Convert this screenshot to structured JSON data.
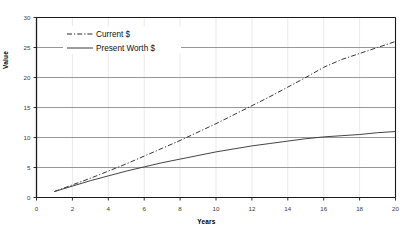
{
  "chart_data": {
    "type": "line",
    "title": "",
    "xlabel": "Years",
    "ylabel": "Value",
    "xlim": [
      0,
      20
    ],
    "ylim": [
      0,
      30
    ],
    "xticks": [
      0,
      2,
      4,
      6,
      8,
      10,
      12,
      14,
      16,
      18,
      20
    ],
    "yticks": [
      0,
      5,
      10,
      15,
      20,
      25,
      30
    ],
    "grid": "horizontal-major-and-vertical-minor",
    "legend_position": "upper-left-inside",
    "x": [
      1,
      2,
      3,
      4,
      5,
      6,
      7,
      8,
      9,
      10,
      11,
      12,
      13,
      14,
      15,
      16,
      17,
      18,
      19,
      20
    ],
    "series": [
      {
        "name": "Current $",
        "style": "dash-dot",
        "color": "#2b2b2b",
        "values": [
          1.0,
          2.1,
          3.2,
          4.4,
          5.6,
          6.9,
          8.2,
          9.5,
          10.9,
          12.3,
          13.8,
          15.3,
          16.8,
          18.4,
          20.0,
          21.7,
          23.0,
          24.0,
          25.0,
          26.0
        ]
      },
      {
        "name": "Present Worth $",
        "style": "solid",
        "color": "#3a3a3a",
        "values": [
          1.0,
          1.9,
          2.8,
          3.6,
          4.4,
          5.1,
          5.8,
          6.4,
          7.0,
          7.6,
          8.1,
          8.6,
          9.0,
          9.4,
          9.8,
          10.1,
          10.3,
          10.5,
          10.8,
          11.0
        ]
      }
    ]
  },
  "axis": {
    "y_tick_labels": [
      "0",
      "5",
      "10",
      "15",
      "20",
      "25",
      "30"
    ],
    "x_tick_labels": [
      "0",
      "2",
      "4",
      "6",
      "8",
      "10",
      "12",
      "14",
      "16",
      "18",
      "20"
    ],
    "y_title": "Value",
    "x_title": "Years"
  },
  "legend": {
    "items": [
      {
        "label": "Current $"
      },
      {
        "label": "Present Worth $"
      }
    ]
  }
}
